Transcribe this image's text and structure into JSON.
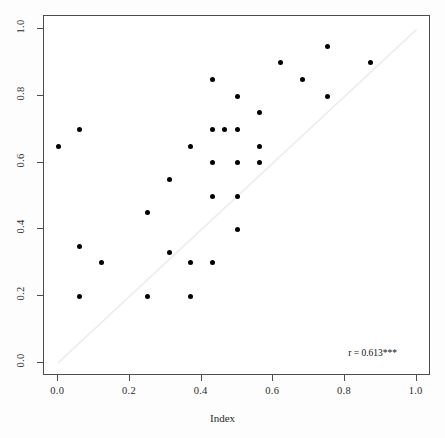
{
  "chart_data": {
    "type": "scatter",
    "title": "",
    "xlabel": "Index",
    "ylabel": "",
    "xlim": [
      -0.04,
      1.04
    ],
    "ylim": [
      -0.04,
      1.04
    ],
    "grid": false,
    "legend": null,
    "xticks": [
      0.0,
      0.2,
      0.4,
      0.6,
      0.8,
      1.0
    ],
    "yticks": [
      0.0,
      0.2,
      0.4,
      0.6,
      0.8,
      1.0
    ],
    "xticklabels": [
      "0.0",
      "0.2",
      "0.4",
      "0.6",
      "0.8",
      "1.0"
    ],
    "yticklabels": [
      "0.0",
      "0.2",
      "0.4",
      "0.6",
      "0.8",
      "1.0"
    ],
    "annotations": [
      {
        "text": "r = 0.613***",
        "x": 0.88,
        "y": 0.02
      }
    ],
    "reference_line": {
      "type": "identity",
      "from": [
        0.0,
        0.0
      ],
      "to": [
        1.0,
        1.0
      ],
      "color": "#ededed"
    },
    "marker": {
      "shape": "circle",
      "color": "#000000",
      "size": 5
    },
    "points": [
      {
        "x": 0.0,
        "y": 0.65
      },
      {
        "x": 0.06,
        "y": 0.7
      },
      {
        "x": 0.06,
        "y": 0.35
      },
      {
        "x": 0.06,
        "y": 0.2
      },
      {
        "x": 0.12,
        "y": 0.3
      },
      {
        "x": 0.25,
        "y": 0.45
      },
      {
        "x": 0.25,
        "y": 0.2
      },
      {
        "x": 0.31,
        "y": 0.55
      },
      {
        "x": 0.31,
        "y": 0.33
      },
      {
        "x": 0.37,
        "y": 0.65
      },
      {
        "x": 0.37,
        "y": 0.3
      },
      {
        "x": 0.37,
        "y": 0.2
      },
      {
        "x": 0.43,
        "y": 0.85
      },
      {
        "x": 0.43,
        "y": 0.7
      },
      {
        "x": 0.43,
        "y": 0.6
      },
      {
        "x": 0.43,
        "y": 0.5
      },
      {
        "x": 0.43,
        "y": 0.3
      },
      {
        "x": 0.465,
        "y": 0.7
      },
      {
        "x": 0.5,
        "y": 0.8
      },
      {
        "x": 0.5,
        "y": 0.7
      },
      {
        "x": 0.5,
        "y": 0.6
      },
      {
        "x": 0.5,
        "y": 0.5
      },
      {
        "x": 0.5,
        "y": 0.4
      },
      {
        "x": 0.56,
        "y": 0.75
      },
      {
        "x": 0.56,
        "y": 0.65
      },
      {
        "x": 0.56,
        "y": 0.6
      },
      {
        "x": 0.62,
        "y": 0.9
      },
      {
        "x": 0.68,
        "y": 0.85
      },
      {
        "x": 0.75,
        "y": 0.95
      },
      {
        "x": 0.75,
        "y": 0.8
      },
      {
        "x": 0.87,
        "y": 0.9
      }
    ]
  }
}
